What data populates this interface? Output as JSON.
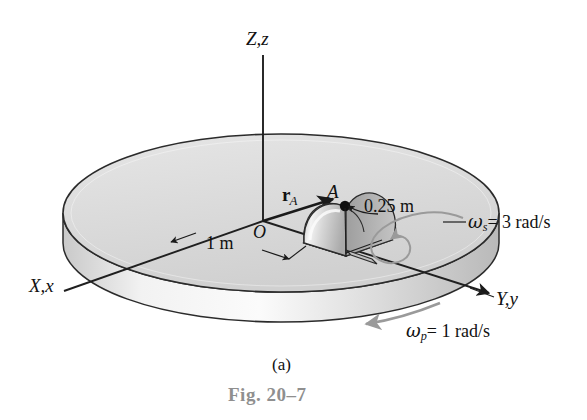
{
  "figure": {
    "caption_part": "(a)",
    "caption_fig": "Fig. 20–7",
    "caption_fig_color": "#8f8f8f"
  },
  "axes": {
    "vertical_label": "Z,z",
    "left_label": "X,x",
    "right_label": "Y,y"
  },
  "points": {
    "origin_label": "O",
    "point_a_label": "A",
    "vector_r_symbol": "r",
    "vector_r_subscript": "A"
  },
  "dimensions": {
    "disk_radius": "1 m",
    "rotor_radius": "0.25 m"
  },
  "angular_velocities": {
    "spin_symbol": "ω",
    "spin_subscript": "s",
    "spin_value": "= 3 rad/s",
    "precession_symbol": "ω",
    "precession_subscript": "p",
    "precession_value": "= 1 rad/s"
  },
  "colors": {
    "disk_top": "#dedede",
    "disk_side": "#d2d2d2",
    "outline": "#2b2b2b",
    "arrow_gray": "#9a9a9a",
    "caption_gray": "#8f8f8f"
  }
}
